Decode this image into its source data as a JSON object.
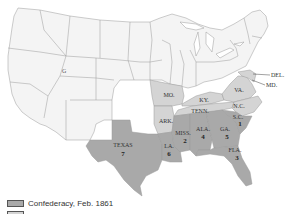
{
  "map": {
    "colors": {
      "union": "#f4f4f4",
      "border_upper_south": "#d4d4d4",
      "confederacy_feb_1861": "#a9a9a9",
      "state_border": "#9a9a9a"
    },
    "state_labels": {
      "texas": {
        "name": "TEXAS",
        "order": "7"
      },
      "louisiana": {
        "name": "LA.",
        "order": "6"
      },
      "mississippi": {
        "name": "MISS.",
        "order": "2"
      },
      "alabama": {
        "name": "ALA.",
        "order": "4"
      },
      "georgia": {
        "name": "GA.",
        "order": "5"
      },
      "south_carolina": {
        "name": "S.C.",
        "order": "1"
      },
      "florida": {
        "name": "FLA.",
        "order": "3"
      },
      "missouri": {
        "name": "MO."
      },
      "arkansas": {
        "name": "ARK."
      },
      "kentucky": {
        "name": "KY."
      },
      "tennessee": {
        "name": "TENN."
      },
      "virginia": {
        "name": "VA."
      },
      "north_carolina": {
        "name": "N.C."
      },
      "delaware": {
        "name": "DEL."
      },
      "maryland": {
        "name": "MD."
      }
    }
  },
  "legend": {
    "items": [
      {
        "label": "Confederacy, Feb. 1861",
        "color": "#a9a9a9"
      },
      {
        "label": "",
        "color": "#d4d4d4"
      }
    ]
  }
}
